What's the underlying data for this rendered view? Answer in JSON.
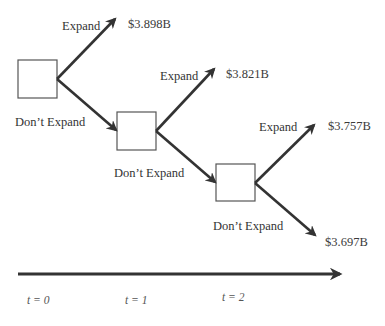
{
  "diagram": {
    "type": "decision-tree",
    "nodes": [
      {
        "id": "n0",
        "x": 18,
        "y": 60,
        "w": 39,
        "h": 38,
        "bottom_label": "Don’t Expand"
      },
      {
        "id": "n1",
        "x": 117,
        "y": 112,
        "w": 39,
        "h": 38,
        "bottom_label": "Don’t Expand"
      },
      {
        "id": "n2",
        "x": 216,
        "y": 164,
        "w": 39,
        "h": 37,
        "bottom_label": "Don’t Expand"
      }
    ],
    "edges": [
      {
        "from": "n0",
        "label": "Expand",
        "outcome": "$3.898B"
      },
      {
        "from": "n0",
        "label": "Don’t Expand",
        "to": "n1"
      },
      {
        "from": "n1",
        "label": "Expand",
        "outcome": "$3.821B"
      },
      {
        "from": "n1",
        "label": "Don’t Expand",
        "to": "n2"
      },
      {
        "from": "n2",
        "label": "Expand",
        "outcome": "$3.757B"
      },
      {
        "from": "n2",
        "label": "Don’t Expand",
        "outcome": "$3.697B"
      }
    ],
    "labels": {
      "expand": "Expand",
      "dont_expand": "Don’t Expand"
    },
    "outcomes": {
      "t0_expand": "$3.898B",
      "t1_expand": "$3.821B",
      "t2_expand": "$3.757B",
      "t2_dont_expand": "$3.697B"
    },
    "timeline": {
      "ticks": [
        "t = 0",
        "t = 1",
        "t = 2"
      ]
    },
    "colors": {
      "line": "#333333",
      "box_border": "#555555",
      "text": "#333333"
    }
  }
}
